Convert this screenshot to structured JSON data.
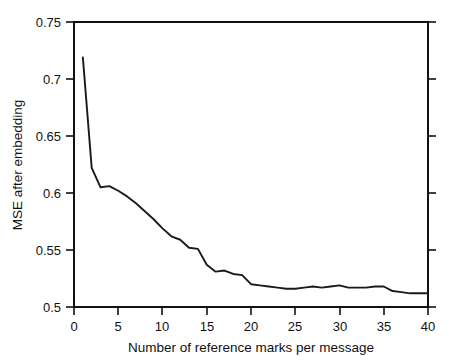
{
  "chart_data": {
    "type": "line",
    "title": "",
    "subtitle": "",
    "xlabel": "Number of reference marks per message",
    "ylabel": "MSE after embedding",
    "xlim": [
      0,
      40
    ],
    "ylim": [
      0.5,
      0.75
    ],
    "xticks": [
      0,
      5,
      10,
      15,
      20,
      25,
      30,
      35,
      40
    ],
    "xtick_labels": [
      "0",
      "5",
      "10",
      "15",
      "20",
      "25",
      "30",
      "35",
      "40"
    ],
    "yticks": [
      0.5,
      0.55,
      0.6,
      0.65,
      0.7,
      0.75
    ],
    "ytick_labels": [
      "0.5",
      "0.55",
      "0.6",
      "0.65",
      "0.7",
      "0.75"
    ],
    "grid": false,
    "legend": null,
    "annotations": [],
    "line_color": "#1a1a1a",
    "axis_color": "#111111",
    "background_color": "#ffffff",
    "series": [
      {
        "name": "MSE after embedding",
        "x": [
          1,
          2,
          3,
          4,
          5,
          6,
          7,
          8,
          9,
          10,
          11,
          12,
          13,
          14,
          15,
          16,
          17,
          18,
          19,
          20,
          21,
          22,
          23,
          24,
          25,
          26,
          27,
          28,
          29,
          30,
          31,
          32,
          33,
          34,
          35,
          36,
          37,
          38,
          39,
          40
        ],
        "values": [
          0.719,
          0.622,
          0.605,
          0.606,
          0.602,
          0.597,
          0.591,
          0.584,
          0.577,
          0.569,
          0.562,
          0.559,
          0.552,
          0.551,
          0.537,
          0.531,
          0.532,
          0.529,
          0.528,
          0.52,
          0.519,
          0.518,
          0.517,
          0.516,
          0.516,
          0.517,
          0.518,
          0.517,
          0.518,
          0.519,
          0.517,
          0.517,
          0.517,
          0.518,
          0.518,
          0.514,
          0.513,
          0.512,
          0.512,
          0.512
        ]
      }
    ]
  }
}
